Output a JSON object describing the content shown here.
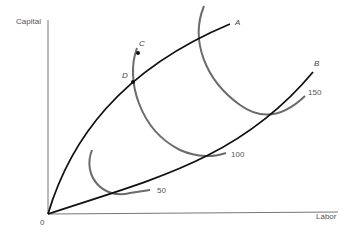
{
  "diagram": {
    "type": "economics-isoquant-expansion-paths",
    "axes": {
      "y_label": "Capital",
      "x_label": "Labor",
      "origin_label": "0"
    },
    "expansion_paths": [
      {
        "label": "A"
      },
      {
        "label": "B"
      }
    ],
    "isoquants": [
      {
        "label": "50"
      },
      {
        "label": "100"
      },
      {
        "label": "150"
      }
    ],
    "points": [
      {
        "label": "C"
      },
      {
        "label": "D"
      }
    ],
    "colors": {
      "axis": "#666666",
      "path": "#111111",
      "isoquant": "#6b6b6b"
    }
  }
}
